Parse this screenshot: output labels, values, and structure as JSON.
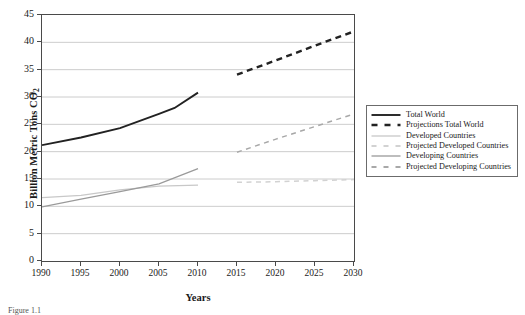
{
  "chart_data": {
    "type": "line",
    "title": "",
    "xlabel": "Years",
    "ylabel": "Billion Metric Tons CO2",
    "ylabel_display": "Billion Metric Tons CO",
    "ylabel_sub": "2",
    "xlim": [
      1990,
      2030
    ],
    "ylim": [
      0,
      45
    ],
    "yticks": [
      0,
      5,
      10,
      15,
      20,
      25,
      30,
      35,
      40,
      45
    ],
    "xticks": [
      1990,
      1995,
      2000,
      2005,
      2010,
      2015,
      2020,
      2025,
      2030
    ],
    "grid": "horizontal",
    "legend_position": "right-outside",
    "series": [
      {
        "name": "Total World",
        "style": "solid",
        "color": "#222222",
        "x": [
          1990,
          1995,
          2000,
          2005,
          2007,
          2010
        ],
        "values": [
          21.2,
          22.6,
          24.3,
          26.9,
          28.0,
          30.8
        ]
      },
      {
        "name": "Projections Total World",
        "style": "dashed",
        "color": "#222222",
        "x": [
          2015,
          2020,
          2025,
          2030
        ],
        "values": [
          34.1,
          36.7,
          39.4,
          42.0
        ]
      },
      {
        "name": "Developed Countries",
        "style": "solid",
        "color": "#c8c8c8",
        "x": [
          1990,
          1995,
          2000,
          2005,
          2010
        ],
        "values": [
          11.6,
          12.0,
          13.0,
          13.7,
          13.9
        ]
      },
      {
        "name": "Projected Developed Countries",
        "style": "dashed",
        "color": "#d2d2d2",
        "x": [
          2015,
          2020,
          2025,
          2030
        ],
        "values": [
          14.4,
          14.5,
          14.7,
          14.9
        ]
      },
      {
        "name": "Developing Countries",
        "style": "solid",
        "color": "#9a9a9a",
        "x": [
          1990,
          1995,
          2000,
          2005,
          2010
        ],
        "values": [
          9.9,
          11.3,
          12.7,
          14.1,
          16.9
        ]
      },
      {
        "name": "Projected Developing Countries",
        "style": "dashed",
        "color": "#a8a8a8",
        "x": [
          2015,
          2020,
          2025,
          2030
        ],
        "values": [
          19.9,
          22.3,
          24.6,
          26.9
        ]
      }
    ]
  },
  "legend": {
    "items": [
      {
        "label": "Total World"
      },
      {
        "label": "Projections Total World"
      },
      {
        "label": "Developed Countries"
      },
      {
        "label": "Projected Developed Countries"
      },
      {
        "label": "Developing Countries"
      },
      {
        "label": "Projected Developing Countries"
      }
    ]
  },
  "caption": {
    "text": "Figure 1.1"
  }
}
